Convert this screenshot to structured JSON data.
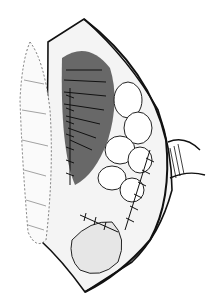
{
  "image": {
    "description": "Black-and-white surgical illustration of an opened abdominal incision with sutured bowel loops",
    "colors": {
      "background": "#ffffff",
      "ink": "#111111",
      "shade": "#555555"
    }
  }
}
